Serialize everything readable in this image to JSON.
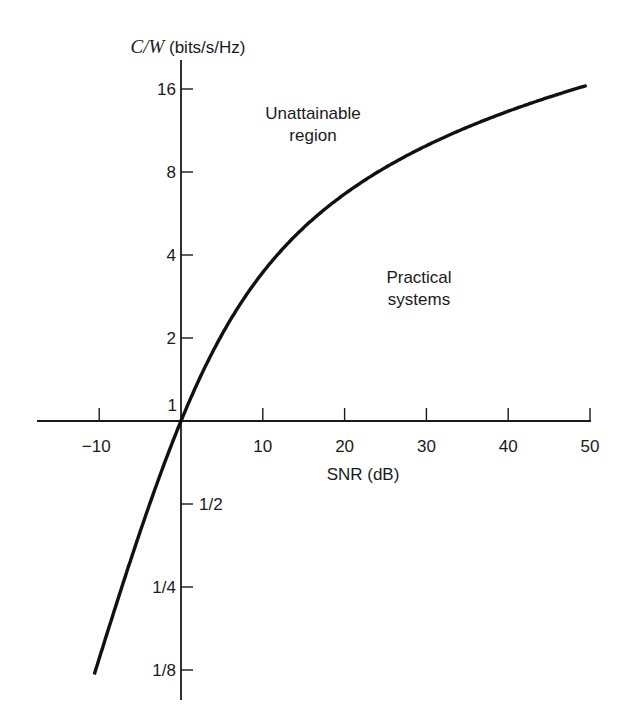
{
  "chart_data": {
    "type": "line",
    "title": "",
    "xlabel": "SNR (dB)",
    "ylabel_var": "C/W",
    "ylabel_unit": "(bits/s/Hz)",
    "yscale": "log2",
    "xlim": [
      -17,
      50
    ],
    "ylim": [
      0.09,
      20
    ],
    "grid": false,
    "legend": null,
    "x_ticks": [
      -10,
      10,
      20,
      30,
      40,
      50
    ],
    "x_tick_labels": [
      "−10",
      "10",
      "20",
      "30",
      "40",
      "50"
    ],
    "y_ticks": [
      16,
      8,
      4,
      2,
      1,
      0.5,
      0.25,
      0.125
    ],
    "y_tick_labels": [
      "16",
      "8",
      "4",
      "2",
      "1",
      "1/2",
      "1/4",
      "1/8"
    ],
    "series": [
      {
        "name": "Shannon limit C/W = log2(1 + SNR)",
        "x": [
          -10.6,
          -10,
          -8,
          -6,
          -4,
          -2,
          0,
          2,
          4,
          6,
          8,
          10,
          15,
          20,
          25,
          30,
          35,
          40,
          45,
          50
        ],
        "values": [
          0.12,
          0.137,
          0.21,
          0.32,
          0.49,
          0.73,
          1.0,
          1.37,
          1.87,
          2.57,
          3.15,
          3.46,
          5.03,
          6.66,
          8.31,
          9.97,
          11.63,
          13.29,
          14.95,
          16.61
        ]
      }
    ],
    "annotations": [
      {
        "text": "Unattainable region",
        "x": 20,
        "y": 12
      },
      {
        "text": "Practical systems",
        "x": 35,
        "y": 2.8
      }
    ]
  },
  "labels": {
    "y_title_var": "C/W",
    "y_title_unit": "(bits/s/Hz)",
    "x_title": "SNR (dB)",
    "region_upper_line1": "Unattainable",
    "region_upper_line2": "region",
    "region_lower_line1": "Practical",
    "region_lower_line2": "systems",
    "origin_label": "1"
  },
  "style": {
    "axis_color": "#1a1a1a",
    "curve_color": "#111111",
    "text_color": "#1a1a1a"
  }
}
